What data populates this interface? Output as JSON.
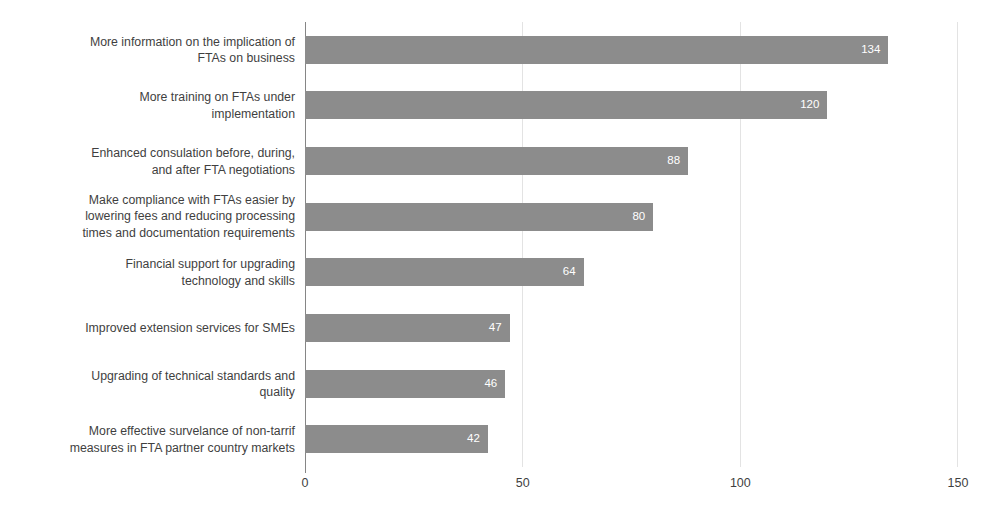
{
  "chart_data": {
    "type": "bar",
    "orientation": "horizontal",
    "title": "",
    "xlabel": "",
    "ylabel": "",
    "xlim": [
      0,
      150
    ],
    "xticks": [
      "0",
      "50",
      "100",
      "150"
    ],
    "xtick_values": [
      0,
      50,
      100,
      150
    ],
    "grid": "vertical",
    "legend": "none",
    "bar_color": "#8c8c8c",
    "label_color": "#3f3f3f",
    "value_label_color": "#ffffff",
    "gridline_color": "#e3e3e3",
    "axis_color": "#868686",
    "categories": [
      "More information on the implication of\nFTAs on business",
      "More training on FTAs under\nimplementation",
      "Enhanced consulation before, during,\nand after FTA negotiations",
      "Make compliance with FTAs easier by\nlowering fees and reducing processing\ntimes and documentation requirements",
      "Financial support for upgrading\ntechnology and skills",
      "Improved extension services for SMEs",
      "Upgrading of technical standards and\nquality",
      "More effective survelance of non-tarrif\nmeasures in FTA partner country markets"
    ],
    "values": [
      134,
      120,
      88,
      80,
      64,
      47,
      46,
      42
    ],
    "value_labels": [
      "134",
      "120",
      "88",
      "80",
      "64",
      "47",
      "46",
      "42"
    ]
  }
}
